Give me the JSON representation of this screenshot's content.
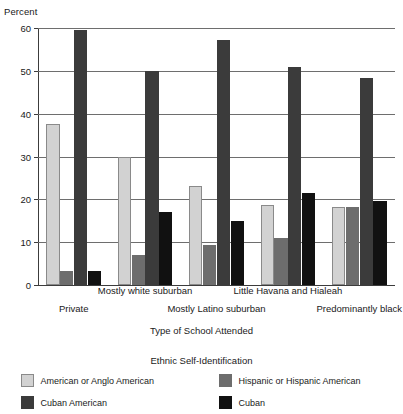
{
  "chart_data": {
    "type": "bar",
    "title": "",
    "xlabel": "Type of School Attended",
    "ylabel": "Percent",
    "ylim": [
      0,
      60
    ],
    "yticks": [
      0,
      10,
      20,
      30,
      40,
      50,
      60
    ],
    "grid": true,
    "legend_title": "Ethnic Self-Identification",
    "legend_position": "bottom",
    "categories": [
      "Private",
      "Mostly white suburban",
      "Mostly Latino suburban",
      "Little Havana and Hialeah",
      "Predominantly black"
    ],
    "series": [
      {
        "name": "American or Anglo American",
        "color": "#d2d2d2",
        "values": [
          37.5,
          30.0,
          23.0,
          18.7,
          18.2
        ]
      },
      {
        "name": "Hispanic or Hispanic American",
        "color": "#6d6d6d",
        "values": [
          3.2,
          7.0,
          9.4,
          11.0,
          18.3
        ]
      },
      {
        "name": "Cuban American",
        "color": "#3b3b3b",
        "values": [
          59.5,
          50.0,
          57.3,
          51.0,
          48.3
        ]
      },
      {
        "name": "Cuban",
        "color": "#111111",
        "values": [
          3.2,
          17.0,
          14.9,
          21.5,
          19.7
        ]
      }
    ]
  },
  "axes": {
    "y_title": "Percent",
    "x_title": "Type of School Attended",
    "y_tick_labels": [
      "0",
      "10",
      "20",
      "30",
      "40",
      "50",
      "60"
    ]
  },
  "legend": {
    "title": "Ethnic Self-Identification",
    "items": [
      {
        "label": "American or Anglo American",
        "swatch": "swatch-anglo"
      },
      {
        "label": "Hispanic or Hispanic American",
        "swatch": "swatch-hispanic"
      },
      {
        "label": "Cuban American",
        "swatch": "swatch-cubanam"
      },
      {
        "label": "Cuban",
        "swatch": "swatch-cuban"
      }
    ]
  }
}
